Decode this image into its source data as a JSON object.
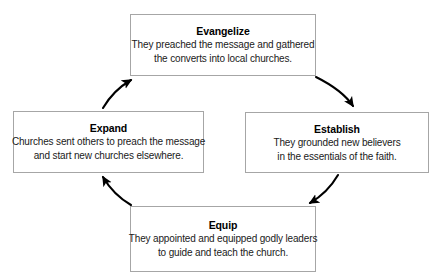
{
  "diagram": {
    "type": "cycle",
    "direction": "clockwise",
    "stroke_color": "#000000",
    "box_border_color": "#a6a6a6",
    "box_fill_color": "#ffffff",
    "text_color": "#000000",
    "nodes": [
      {
        "id": "evangelize",
        "title": "Evangelize",
        "lines": [
          "They preached the message and gathered",
          "the converts into local churches."
        ],
        "position": "top"
      },
      {
        "id": "establish",
        "title": "Establish",
        "lines": [
          "They grounded new believers",
          "in the essentials of the faith."
        ],
        "position": "right"
      },
      {
        "id": "equip",
        "title": "Equip",
        "lines": [
          "They appointed and equipped godly leaders",
          "to guide and teach the church."
        ],
        "position": "bottom"
      },
      {
        "id": "expand",
        "title": "Expand",
        "lines": [
          "Churches sent others to preach the message",
          "and start new churches elsewhere."
        ],
        "position": "left"
      }
    ],
    "arrows": [
      {
        "id": "evangelize-to-establish",
        "from": "evangelize",
        "to": "establish"
      },
      {
        "id": "establish-to-equip",
        "from": "establish",
        "to": "equip"
      },
      {
        "id": "equip-to-expand",
        "from": "equip",
        "to": "expand"
      },
      {
        "id": "expand-to-evangelize",
        "from": "expand",
        "to": "evangelize"
      }
    ]
  }
}
